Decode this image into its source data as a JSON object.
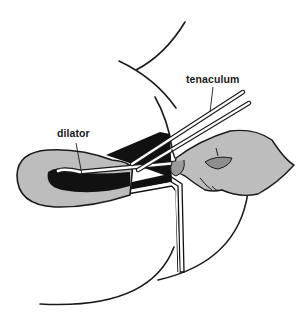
{
  "figure": {
    "labels": {
      "tenaculum": "tenaculum",
      "dilator": "dilator"
    },
    "colors": {
      "line": "#1a1a1a",
      "tissue_fill": "#bdbdbd",
      "cavity_fill": "#111111",
      "instrument_fill": "#ffffff",
      "background": "#ffffff"
    }
  }
}
